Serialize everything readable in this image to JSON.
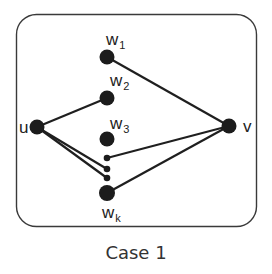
{
  "diagram": {
    "caption": "Case 1",
    "colors": {
      "node": "#1c1c1c",
      "edge": "#1f1f1f",
      "frame": "#3a3a3a"
    },
    "nodes": {
      "u": {
        "label": "u",
        "sub": ""
      },
      "v": {
        "label": "v",
        "sub": ""
      },
      "w1": {
        "label": "w",
        "sub": "1"
      },
      "w2": {
        "label": "w",
        "sub": "2"
      },
      "w3": {
        "label": "w",
        "sub": "3"
      },
      "wk": {
        "label": "w",
        "sub": "k"
      }
    },
    "ellipsis_dots": 3,
    "edges": [
      [
        "w1",
        "v"
      ],
      [
        "u",
        "w2"
      ],
      [
        "u",
        "dot2"
      ],
      [
        "u",
        "dot3"
      ],
      [
        "v",
        "dot1"
      ],
      [
        "v",
        "wk"
      ]
    ]
  }
}
